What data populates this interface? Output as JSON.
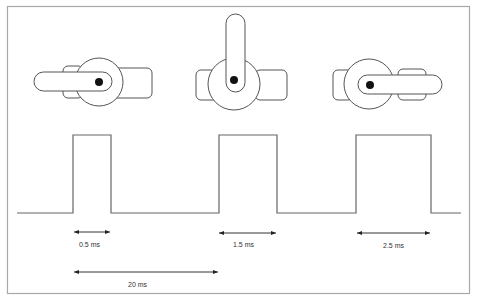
{
  "diagram": {
    "colors": {
      "background": "#ffffff",
      "frame": "#a8a8a8",
      "stroke": "#555555",
      "hub_dot": "#111111",
      "text": "#333333"
    },
    "servos": [
      {
        "name": "servo-left",
        "position": "horn pointing left",
        "pulse": "0.5 ms"
      },
      {
        "name": "servo-center",
        "position": "horn pointing up",
        "pulse": "1.5 ms"
      },
      {
        "name": "servo-right",
        "position": "horn pointing right",
        "pulse": "2.5 ms"
      }
    ],
    "labels": {
      "pulse_1": "0.5 ms",
      "pulse_2": "1.5 ms",
      "pulse_3": "2.5 ms",
      "period": "20 ms"
    }
  }
}
